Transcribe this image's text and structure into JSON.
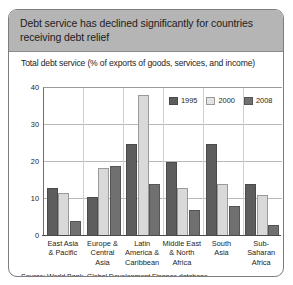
{
  "figure": {
    "title": "Debt service has declined significantly for countries receiving debt relief",
    "subtitle": "Total debt service (% of exports of goods, services, and income)",
    "source": "Source: World Bank, Global Development Finance database"
  },
  "colors": {
    "banner": "#b5b5b5",
    "series_1995": "#5d5d5d",
    "series_2000": "#d9d9d9",
    "series_2008": "#707070",
    "grid": "#b9b9b9",
    "axis": "#4a4a4a"
  },
  "chart_data": {
    "type": "bar",
    "title": "Debt service has declined significantly for countries receiving debt relief",
    "subtitle": "Total debt service (% of exports of goods, services, and income)",
    "xlabel": "",
    "ylabel": "",
    "ylim": [
      0,
      40
    ],
    "yticks": [
      0,
      10,
      20,
      30,
      40
    ],
    "ytick_labels": [
      "0",
      "10",
      "20",
      "30",
      "40"
    ],
    "grid": true,
    "legend_position": "upper-right-inside",
    "categories": [
      "East Asia & Pacific",
      "Europe & Central Asia",
      "Latin America & Caribbean",
      "Middle East & North Africa",
      "South Asia",
      "Sub-Saharan Africa"
    ],
    "category_lines": [
      [
        "East Asia",
        "& Pacific"
      ],
      [
        "Europe &",
        "Central",
        "Asia"
      ],
      [
        "Latin",
        "America &",
        "Caribbean"
      ],
      [
        "Middle East",
        "& North",
        "Africa"
      ],
      [
        "South",
        "Asia"
      ],
      [
        "Sub-",
        "Saharan",
        "Africa"
      ]
    ],
    "series": [
      {
        "name": "1995",
        "color": "#5d5d5d",
        "values": [
          13.0,
          10.5,
          25.0,
          20.0,
          25.0,
          14.0
        ]
      },
      {
        "name": "2000",
        "color": "#d9d9d9",
        "values": [
          11.5,
          18.5,
          38.0,
          13.0,
          14.0,
          11.0
        ]
      },
      {
        "name": "2008",
        "color": "#707070",
        "values": [
          4.0,
          19.0,
          14.0,
          7.0,
          8.0,
          3.0
        ]
      }
    ]
  }
}
